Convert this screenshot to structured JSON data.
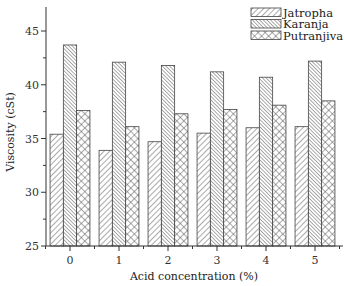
{
  "chart_data": {
    "type": "bar",
    "title": "",
    "xlabel": "Acid concentration (%)",
    "ylabel": "Viscosity (cSt)",
    "categories": [
      "0",
      "1",
      "2",
      "3",
      "4",
      "5"
    ],
    "series": [
      {
        "name": "Jatropha",
        "pattern": "diagonal-up",
        "values": [
          35.4,
          33.9,
          34.7,
          35.5,
          36.0,
          36.1
        ]
      },
      {
        "name": "Karanja",
        "pattern": "diagonal-down-dense",
        "values": [
          43.7,
          42.1,
          41.8,
          41.2,
          40.7,
          42.2
        ]
      },
      {
        "name": "Putranjiva",
        "pattern": "crosshatch",
        "values": [
          37.6,
          36.1,
          37.3,
          37.7,
          38.1,
          38.5
        ]
      }
    ],
    "ylim": [
      25,
      47
    ],
    "yticks": [
      25,
      30,
      35,
      40,
      45
    ],
    "grid": false,
    "legend_position": "top-right"
  },
  "colors": {
    "stroke": "#444444",
    "axis": "#333333",
    "background": "#ffffff"
  }
}
